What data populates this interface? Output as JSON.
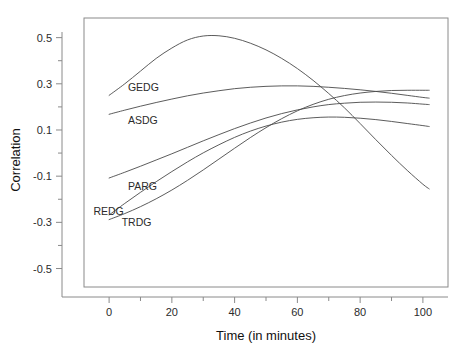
{
  "chart_data": {
    "type": "line",
    "title": "",
    "subtitle": "",
    "xlabel": "Time (in minutes)",
    "ylabel": "Correlation",
    "xlim": [
      -8,
      108
    ],
    "ylim": [
      -0.58,
      0.585
    ],
    "grid": false,
    "legend_position": "inline-labels",
    "x_ticks": [
      0,
      20,
      40,
      60,
      80,
      100
    ],
    "x_tick_labels": [
      "0",
      "20",
      "40",
      "60",
      "80",
      "100"
    ],
    "x_minor_ticks": [
      10,
      30,
      50,
      70,
      90
    ],
    "y_ticks": [
      0.5,
      0.3,
      0.1,
      -0.1,
      -0.3,
      -0.5
    ],
    "y_tick_labels": [
      "0.5",
      "0.3",
      "0.1",
      "-0.1",
      "-0.3",
      "-0.5"
    ],
    "x": [
      0,
      5,
      10,
      15,
      20,
      25,
      30,
      35,
      40,
      45,
      50,
      55,
      60,
      65,
      70,
      75,
      80,
      85,
      90,
      95,
      100,
      102
    ],
    "series": [
      {
        "name": "GEDG",
        "label": "GEDG",
        "color": "#4a4a4a",
        "label_x": 6,
        "label_y": 0.285,
        "values": [
          0.25,
          0.3,
          0.355,
          0.41,
          0.455,
          0.49,
          0.507,
          0.508,
          0.497,
          0.476,
          0.447,
          0.41,
          0.366,
          0.315,
          0.258,
          0.196,
          0.128,
          0.058,
          -0.01,
          -0.075,
          -0.135,
          -0.155
        ]
      },
      {
        "name": "ASDG",
        "label": "ASDG",
        "color": "#4a4a4a",
        "label_x": 6,
        "label_y": 0.145,
        "values": [
          0.168,
          0.186,
          0.203,
          0.219,
          0.234,
          0.248,
          0.26,
          0.27,
          0.279,
          0.285,
          0.289,
          0.291,
          0.291,
          0.289,
          0.285,
          0.28,
          0.274,
          0.267,
          0.259,
          0.25,
          0.241,
          0.238
        ]
      },
      {
        "name": "PARG",
        "label": "PARG",
        "color": "#4a4a4a",
        "label_x": 6,
        "label_y": -0.142,
        "values": [
          -0.108,
          -0.083,
          -0.057,
          -0.03,
          -0.003,
          0.025,
          0.053,
          0.08,
          0.106,
          0.13,
          0.152,
          0.171,
          0.187,
          0.2,
          0.21,
          0.216,
          0.22,
          0.221,
          0.22,
          0.217,
          0.212,
          0.21
        ]
      },
      {
        "name": "REDG",
        "label": "REDG",
        "color": "#4a4a4a",
        "label_x": -5,
        "label_y": -0.253,
        "values": [
          -0.268,
          -0.218,
          -0.17,
          -0.124,
          -0.08,
          -0.038,
          0.001,
          0.036,
          0.068,
          0.095,
          0.117,
          0.134,
          0.146,
          0.153,
          0.156,
          0.155,
          0.151,
          0.145,
          0.137,
          0.128,
          0.119,
          0.115
        ]
      },
      {
        "name": "TRDG",
        "label": "TRDG",
        "color": "#4a4a4a",
        "label_x": 4,
        "label_y": -0.3,
        "values": [
          -0.288,
          -0.262,
          -0.232,
          -0.198,
          -0.16,
          -0.118,
          -0.073,
          -0.026,
          0.021,
          0.067,
          0.11,
          0.149,
          0.183,
          0.211,
          0.233,
          0.249,
          0.26,
          0.267,
          0.271,
          0.272,
          0.272,
          0.272
        ]
      }
    ]
  }
}
